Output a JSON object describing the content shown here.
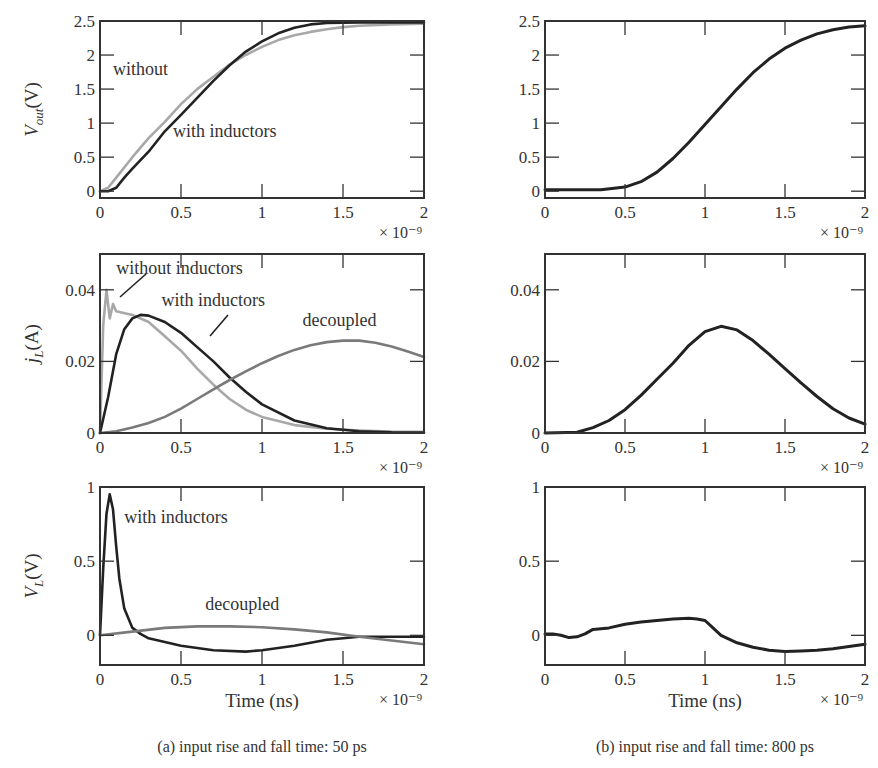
{
  "figure": {
    "captions": [
      "(a) input rise and fall time: 50 ps",
      "(b) input rise and fall time: 800 ps"
    ],
    "x_axis_label": "Time (ns)",
    "x_exponent_label": "× 10⁻⁹"
  },
  "colors": {
    "with_inductors": "#222222",
    "without_inductors": "#a8a8a8",
    "decoupled": "#7a7a7a",
    "axes": "#333333"
  },
  "chart_data": [
    {
      "id": "a-vout",
      "type": "line",
      "title": "",
      "column": "a",
      "ylabel": "V_out(V)",
      "xlabel": "",
      "x_exponent": "× 10⁻⁹",
      "xlim": [
        0,
        2e-09
      ],
      "ylim": [
        -0.1,
        2.5
      ],
      "xticks": [
        0,
        0.5,
        1,
        1.5,
        2
      ],
      "yticks": [
        0,
        0.5,
        1,
        1.5,
        2,
        2.5
      ],
      "grid": false,
      "series": [
        {
          "name": "without",
          "x": [
            0,
            0.05,
            0.1,
            0.2,
            0.3,
            0.4,
            0.5,
            0.6,
            0.7,
            0.8,
            0.9,
            1.0,
            1.1,
            1.2,
            1.3,
            1.4,
            1.5,
            1.6,
            1.8,
            2.0
          ],
          "y": [
            0,
            0.05,
            0.2,
            0.5,
            0.78,
            1.02,
            1.28,
            1.5,
            1.68,
            1.86,
            2.0,
            2.12,
            2.22,
            2.29,
            2.34,
            2.38,
            2.41,
            2.43,
            2.45,
            2.46
          ]
        },
        {
          "name": "with inductors",
          "x": [
            0,
            0.05,
            0.1,
            0.15,
            0.2,
            0.3,
            0.4,
            0.5,
            0.6,
            0.7,
            0.8,
            0.9,
            1.0,
            1.1,
            1.2,
            1.3,
            1.4,
            1.6,
            1.8,
            2.0
          ],
          "y": [
            0,
            0.0,
            0.05,
            0.2,
            0.33,
            0.58,
            0.88,
            1.12,
            1.37,
            1.62,
            1.85,
            2.05,
            2.2,
            2.32,
            2.4,
            2.45,
            2.47,
            2.48,
            2.48,
            2.48
          ]
        }
      ],
      "annotations": [
        {
          "text": "without",
          "x": 0.08,
          "y": 1.7
        },
        {
          "text": "with inductors",
          "x": 0.45,
          "y": 0.8
        }
      ]
    },
    {
      "id": "b-vout",
      "type": "line",
      "title": "",
      "column": "b",
      "ylabel": "",
      "xlabel": "",
      "x_exponent": "× 10⁻⁹",
      "xlim": [
        0,
        2e-09
      ],
      "ylim": [
        -0.1,
        2.5
      ],
      "xticks": [
        0,
        0.5,
        1,
        1.5,
        2
      ],
      "yticks": [
        0,
        0.5,
        1,
        1.5,
        2,
        2.5
      ],
      "grid": false,
      "series": [
        {
          "name": "with inductors",
          "x": [
            0,
            0.2,
            0.35,
            0.5,
            0.6,
            0.7,
            0.8,
            0.9,
            1.0,
            1.1,
            1.2,
            1.3,
            1.4,
            1.5,
            1.6,
            1.7,
            1.8,
            1.9,
            2.0
          ],
          "y": [
            0.02,
            0.02,
            0.02,
            0.06,
            0.14,
            0.28,
            0.48,
            0.72,
            0.98,
            1.24,
            1.5,
            1.74,
            1.94,
            2.1,
            2.22,
            2.31,
            2.37,
            2.41,
            2.43
          ]
        }
      ],
      "annotations": []
    },
    {
      "id": "a-jl",
      "type": "line",
      "title": "",
      "column": "a",
      "ylabel": "j_L (A)",
      "xlabel": "",
      "x_exponent": "× 10⁻⁹",
      "xlim": [
        0,
        2e-09
      ],
      "ylim": [
        0,
        0.05
      ],
      "xticks": [
        0,
        0.5,
        1,
        1.5,
        2
      ],
      "yticks": [
        0,
        0.02,
        0.04
      ],
      "grid": false,
      "series": [
        {
          "name": "without inductors",
          "x": [
            0,
            0.02,
            0.04,
            0.06,
            0.08,
            0.1,
            0.2,
            0.3,
            0.4,
            0.5,
            0.6,
            0.7,
            0.8,
            0.9,
            1.0,
            1.2,
            1.4,
            1.6,
            1.8,
            2.0
          ],
          "y": [
            0,
            0.03,
            0.04,
            0.032,
            0.036,
            0.034,
            0.033,
            0.031,
            0.027,
            0.023,
            0.018,
            0.0135,
            0.0095,
            0.0065,
            0.0045,
            0.0022,
            0.0012,
            0.0007,
            0.0004,
            0.0003
          ]
        },
        {
          "name": "with inductors",
          "x": [
            0,
            0.05,
            0.1,
            0.15,
            0.2,
            0.25,
            0.3,
            0.4,
            0.5,
            0.6,
            0.7,
            0.8,
            0.9,
            1.0,
            1.2,
            1.4,
            1.6,
            1.8,
            2.0
          ],
          "y": [
            0,
            0.01,
            0.022,
            0.029,
            0.032,
            0.033,
            0.0328,
            0.031,
            0.028,
            0.024,
            0.02,
            0.0155,
            0.0115,
            0.008,
            0.0035,
            0.0013,
            0.0005,
            0.0002,
            0.0001
          ]
        },
        {
          "name": "decoupled",
          "x": [
            0,
            0.1,
            0.2,
            0.3,
            0.4,
            0.5,
            0.6,
            0.7,
            0.8,
            0.9,
            1.0,
            1.1,
            1.2,
            1.3,
            1.4,
            1.5,
            1.6,
            1.7,
            1.8,
            1.9,
            2.0
          ],
          "y": [
            0,
            0.0005,
            0.0015,
            0.0028,
            0.0045,
            0.0068,
            0.0095,
            0.0122,
            0.0148,
            0.0172,
            0.0195,
            0.0215,
            0.0232,
            0.0245,
            0.0254,
            0.0258,
            0.0258,
            0.0252,
            0.0242,
            0.0228,
            0.0212
          ]
        }
      ],
      "annotations": [
        {
          "text": "without inductors",
          "x": 0.1,
          "y": 0.0445
        },
        {
          "text": "with inductors",
          "x": 0.38,
          "y": 0.0355
        },
        {
          "text": "decoupled",
          "x": 1.25,
          "y": 0.03
        }
      ]
    },
    {
      "id": "b-jl",
      "type": "line",
      "title": "",
      "column": "b",
      "ylabel": "",
      "xlabel": "",
      "x_exponent": "× 10⁻⁹",
      "xlim": [
        0,
        2e-09
      ],
      "ylim": [
        0,
        0.05
      ],
      "xticks": [
        0,
        0.5,
        1,
        1.5,
        2
      ],
      "yticks": [
        0,
        0.02,
        0.04
      ],
      "grid": false,
      "series": [
        {
          "name": "with inductors",
          "x": [
            0,
            0.2,
            0.3,
            0.4,
            0.5,
            0.6,
            0.7,
            0.8,
            0.9,
            1.0,
            1.1,
            1.2,
            1.3,
            1.4,
            1.5,
            1.6,
            1.7,
            1.8,
            1.9,
            2.0
          ],
          "y": [
            0,
            0.0002,
            0.0015,
            0.0035,
            0.0065,
            0.0105,
            0.015,
            0.0195,
            0.0245,
            0.0283,
            0.0298,
            0.0288,
            0.0258,
            0.022,
            0.018,
            0.014,
            0.0102,
            0.0068,
            0.0042,
            0.0025
          ]
        }
      ],
      "annotations": []
    },
    {
      "id": "a-vl",
      "type": "line",
      "title": "",
      "column": "a",
      "ylabel": "V_L (V)",
      "xlabel": "Time (ns)",
      "x_exponent": "× 10⁻⁹",
      "xlim": [
        0,
        2e-09
      ],
      "ylim": [
        -0.2,
        1
      ],
      "xticks": [
        0,
        0.5,
        1,
        1.5,
        2
      ],
      "yticks": [
        0,
        0.5,
        1
      ],
      "grid": false,
      "series": [
        {
          "name": "with inductors",
          "x": [
            0,
            0.02,
            0.04,
            0.06,
            0.08,
            0.1,
            0.12,
            0.15,
            0.2,
            0.25,
            0.3,
            0.5,
            0.7,
            0.9,
            1.0,
            1.2,
            1.4,
            1.6,
            1.8,
            2.0
          ],
          "y": [
            0,
            0.45,
            0.82,
            0.95,
            0.85,
            0.6,
            0.38,
            0.18,
            0.05,
            0.01,
            -0.02,
            -0.07,
            -0.1,
            -0.11,
            -0.1,
            -0.07,
            -0.03,
            -0.01,
            -0.01,
            -0.01
          ]
        },
        {
          "name": "decoupled",
          "x": [
            0,
            0.2,
            0.4,
            0.6,
            0.8,
            1.0,
            1.2,
            1.4,
            1.6,
            1.8,
            2.0
          ],
          "y": [
            0,
            0.025,
            0.05,
            0.06,
            0.06,
            0.055,
            0.04,
            0.02,
            -0.01,
            -0.035,
            -0.06
          ]
        }
      ],
      "annotations": [
        {
          "text": "with inductors",
          "x": 0.15,
          "y": 0.76
        },
        {
          "text": "decoupled",
          "x": 0.65,
          "y": 0.17
        }
      ]
    },
    {
      "id": "b-vl",
      "type": "line",
      "title": "",
      "column": "b",
      "ylabel": "",
      "xlabel": "Time (ns)",
      "x_exponent": "× 10⁻⁹",
      "xlim": [
        0,
        2e-09
      ],
      "ylim": [
        -0.2,
        1
      ],
      "xticks": [
        0,
        0.5,
        1,
        1.5,
        2
      ],
      "yticks": [
        0,
        0.5,
        1
      ],
      "grid": false,
      "series": [
        {
          "name": "with inductors",
          "x": [
            0,
            0.05,
            0.1,
            0.15,
            0.2,
            0.25,
            0.3,
            0.4,
            0.5,
            0.6,
            0.7,
            0.8,
            0.9,
            0.95,
            1.0,
            1.05,
            1.1,
            1.2,
            1.3,
            1.4,
            1.5,
            1.6,
            1.7,
            1.8,
            1.9,
            2.0
          ],
          "y": [
            0.01,
            0.01,
            0.0,
            -0.015,
            -0.01,
            0.01,
            0.04,
            0.05,
            0.075,
            0.09,
            0.1,
            0.11,
            0.115,
            0.11,
            0.1,
            0.05,
            0.0,
            -0.05,
            -0.08,
            -0.1,
            -0.11,
            -0.105,
            -0.1,
            -0.09,
            -0.075,
            -0.06
          ]
        }
      ],
      "annotations": []
    }
  ]
}
